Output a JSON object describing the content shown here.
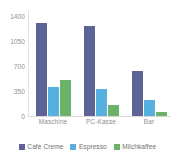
{
  "chart_data": {
    "type": "bar",
    "title": "",
    "subtitle": "",
    "xlabel": "",
    "ylabel": "",
    "categories": [
      "Maschine",
      "PC-Kasse",
      "Bar"
    ],
    "series": [
      {
        "name": "Café Creme",
        "color": "#5b6397",
        "values": [
          1300,
          1260,
          630
        ]
      },
      {
        "name": "Espresso",
        "color": "#56b0e0",
        "values": [
          410,
          380,
          225
        ]
      },
      {
        "name": "Milchkaffee",
        "color": "#6cb36a",
        "values": [
          505,
          155,
          55
        ]
      }
    ],
    "ylim": [
      0,
      1400
    ],
    "yticks": [
      1400,
      1050,
      700,
      350,
      0
    ],
    "ytick_labels": [
      "1400",
      "1050",
      "700",
      "350",
      "0"
    ],
    "grid": false,
    "legend_position": "bottom",
    "annotations": []
  },
  "axis": {
    "tick_color": "#8f8f8f",
    "line_color": "#d9d9d9"
  },
  "background": "#ffffff"
}
